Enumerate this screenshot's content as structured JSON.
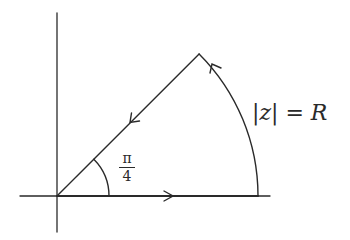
{
  "diagram": {
    "colors": {
      "stroke": "#2a2a2a",
      "background": "#ffffff"
    },
    "geometry": {
      "origin": [
        57,
        196
      ],
      "radius": 201,
      "sector_angle": "π/4",
      "angle_arc_radius": 52
    },
    "labels": {
      "modulus": {
        "bar_left": "|",
        "variable": "z",
        "bar_right": "|",
        "equals": " = ",
        "radius_symbol": "R"
      },
      "angle": {
        "numerator": "π",
        "denominator": "4"
      }
    },
    "arrows": [
      {
        "segment": "real-axis-segment",
        "direction": "right"
      },
      {
        "segment": "circular-arc",
        "direction": "counterclockwise"
      },
      {
        "segment": "diagonal-ray",
        "direction": "toward-origin"
      }
    ]
  }
}
